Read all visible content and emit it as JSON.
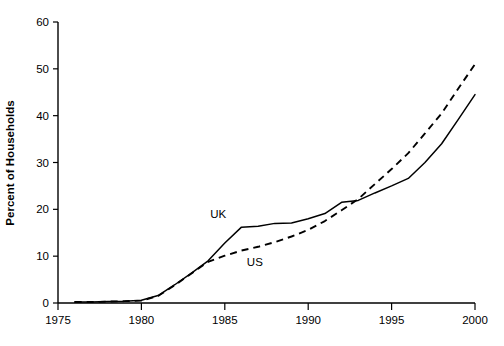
{
  "chart_data": {
    "type": "line",
    "title": "",
    "xlabel": "",
    "ylabel": "Percent of Households",
    "xlim": [
      1975,
      2000
    ],
    "ylim": [
      0,
      60
    ],
    "xticks": [
      1975,
      1980,
      1985,
      1990,
      1995,
      2000
    ],
    "xtick_labels": [
      "1975",
      "1980",
      "1985",
      "1990",
      "1995",
      "2000"
    ],
    "yticks": [
      0,
      10,
      20,
      30,
      40,
      50,
      60
    ],
    "ytick_labels": [
      "0",
      "10",
      "20",
      "30",
      "40",
      "50",
      "60"
    ],
    "grid": false,
    "legend_position": "inline-annotation",
    "series": [
      {
        "name": "UK",
        "style": "solid",
        "color": "#000000",
        "label_text": "UK",
        "x": [
          1976,
          1977,
          1978,
          1979,
          1980,
          1981,
          1982,
          1983,
          1984,
          1985,
          1986,
          1987,
          1988,
          1989,
          1990,
          1991,
          1992,
          1993,
          1994,
          1995,
          1996,
          1997,
          1998,
          1999,
          2000
        ],
        "values": [
          0.2,
          0.2,
          0.3,
          0.4,
          0.6,
          1.6,
          3.9,
          6.4,
          9.0,
          12.8,
          16.2,
          16.4,
          17.0,
          17.1,
          18.0,
          19.1,
          21.5,
          21.9,
          23.5,
          25.0,
          26.6,
          30.0,
          34.0,
          39.2,
          44.5
        ]
      },
      {
        "name": "US",
        "style": "dashed",
        "color": "#000000",
        "label_text": "US",
        "x": [
          1976,
          1977,
          1978,
          1979,
          1980,
          1981,
          1982,
          1983,
          1984,
          1985,
          1986,
          1987,
          1988,
          1989,
          1990,
          1991,
          1992,
          1993,
          1994,
          1995,
          1996,
          1997,
          1998,
          1999,
          2000
        ],
        "values": [
          0.2,
          0.2,
          0.3,
          0.4,
          0.5,
          1.5,
          3.8,
          6.3,
          8.8,
          10.1,
          11.2,
          12.0,
          13.0,
          14.2,
          15.6,
          17.5,
          19.8,
          22.2,
          25.4,
          28.6,
          32.0,
          36.2,
          40.5,
          45.8,
          51.0
        ]
      }
    ],
    "annotations": [
      {
        "text": "UK",
        "x": 1984.6,
        "y": 18.1
      },
      {
        "text": "US",
        "x": 1986.8,
        "y": 7.9
      }
    ]
  },
  "axis_titles": {
    "y": "Percent of Households"
  }
}
